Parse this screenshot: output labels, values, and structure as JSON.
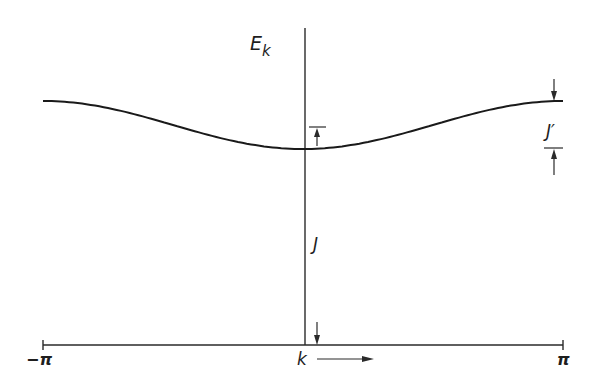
{
  "diagram": {
    "y_axis_label": {
      "main": "E",
      "subscript": "k"
    },
    "x_axis_label": "k",
    "x_axis_arrow": "right-arrow",
    "x_ticks": [
      {
        "label": "−π",
        "value": -3.14159
      },
      {
        "label": "π",
        "value": 3.14159
      }
    ],
    "curve": {
      "description": "E_k = J + J'(1 - cos k)/2 style band: minimum at k=0, maximum (flat) at k=±π",
      "k_range": [
        -3.14159,
        3.14159
      ],
      "min_energy_at_k0": "J",
      "bandwidth": "J'"
    },
    "annotations": [
      {
        "label": "J",
        "meaning": "energy at k = 0 measured from baseline"
      },
      {
        "label": "J′",
        "meaning": "band width between k = 0 and k = ±π"
      }
    ],
    "colors": {
      "ink": "#1e1e1e",
      "background": "#ffffff"
    }
  }
}
